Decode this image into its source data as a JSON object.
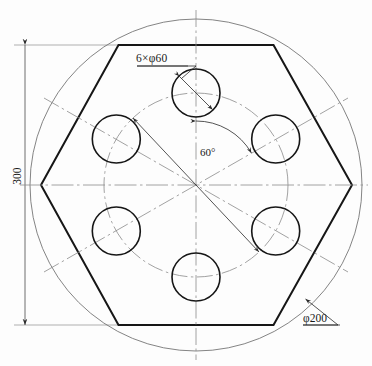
{
  "drawing": {
    "title": "Hexagonal flange plate with six bolt holes",
    "type": "engineering-orthographic-view",
    "units": "mm",
    "colors": {
      "outline": "#1a1a1a",
      "thin": "#6e6e6e",
      "centerline": "#8a8a8a",
      "background": "#fdfdfd"
    },
    "geometry": {
      "center": {
        "x": 196,
        "y": 185
      },
      "outer_circle": {
        "diameter": 200,
        "radius_px": 166
      },
      "hexagon": {
        "sides": 6,
        "across_corners_px": 311,
        "left_vertex": {
          "x": 41,
          "y": 185
        },
        "right_vertex": {
          "x": 352,
          "y": 185
        },
        "top_edge_y": 45,
        "bottom_edge_y": 325
      },
      "bolt_circle": {
        "radius_px": 92,
        "linetype": "dash-dot"
      },
      "holes": {
        "count": 6,
        "diameter": 60,
        "hole_radius_px": 24,
        "angular_pitch_deg": 60,
        "start_angle_deg": 90
      }
    }
  },
  "dimensions": {
    "holes_label": "6×φ60",
    "outer_label": "φ200",
    "angle_label": "60°",
    "height_label": "300"
  }
}
